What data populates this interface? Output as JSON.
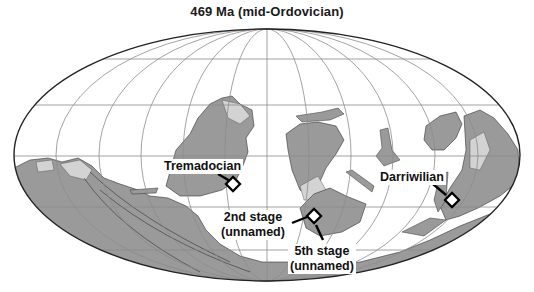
{
  "title": "469 Ma (mid-Ordovician)",
  "map": {
    "projection": "mollweide-like ellipse",
    "colors": {
      "ocean": "#ffffff",
      "land": "#9a9a9a",
      "shelf": "#d3d3d3",
      "grid": "#8c8c8c",
      "outline": "#222222",
      "marker": "#000000"
    },
    "ellipse": {
      "cx": 267,
      "cy": 155,
      "rx": 253,
      "ry": 126
    },
    "parallels_y": [
      59,
      105,
      156,
      207,
      250
    ],
    "meridian_count": 12
  },
  "markers": [
    {
      "id": "tremadocian",
      "label_lines": [
        "Tremadocian"
      ],
      "x": 233,
      "y": 184
    },
    {
      "id": "second-stage",
      "label_lines": [
        "2nd stage",
        "(unnamed)"
      ],
      "x": 314,
      "y": 216
    },
    {
      "id": "fifth-stage",
      "label_lines": [
        "5th stage",
        "(unnamed)"
      ],
      "x": 314,
      "y": 216
    },
    {
      "id": "darriwilian",
      "label_lines": [
        "Darriwilian"
      ],
      "x": 452,
      "y": 200
    }
  ]
}
